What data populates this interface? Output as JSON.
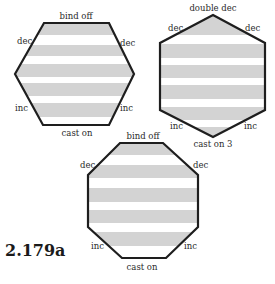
{
  "figure_label": "2.179a",
  "colors": {
    "stripe": "#d3d3d3",
    "outline": "#1e1e1e",
    "background": "#ffffff"
  },
  "shapes": [
    {
      "name": "hexagon-flat-top",
      "labels": {
        "top": "bind off",
        "upper_left": "dec",
        "upper_right": "dec",
        "lower_left": "inc",
        "lower_right": "inc",
        "bottom": "cast on"
      },
      "stripe_count": 5
    },
    {
      "name": "hexagon-pointed-top",
      "labels": {
        "top": "double dec",
        "upper_left": "dec",
        "upper_right": "dec",
        "lower_left": "inc",
        "lower_right": "inc",
        "bottom": "cast on 3"
      },
      "stripe_count": 6
    },
    {
      "name": "octagon",
      "labels": {
        "top": "bind off",
        "upper_left": "dec",
        "upper_right": "dec",
        "lower_left": "inc",
        "lower_right": "inc",
        "bottom": "cast on"
      },
      "stripe_count": 5
    }
  ]
}
